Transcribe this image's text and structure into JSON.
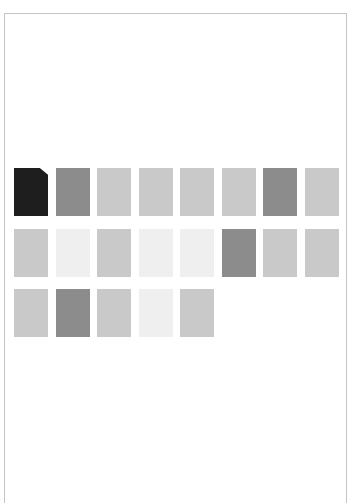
{
  "palette": {
    "black": "#1e1e1e",
    "dark": "#8c8c8c",
    "light": "#c9c9c9",
    "pale": "#efefef"
  },
  "tiles": [
    {
      "row": 1,
      "col": 1,
      "shade": "black",
      "folded": true
    },
    {
      "row": 1,
      "col": 2,
      "shade": "dark",
      "folded": false
    },
    {
      "row": 1,
      "col": 3,
      "shade": "light",
      "folded": false
    },
    {
      "row": 1,
      "col": 4,
      "shade": "light",
      "folded": false
    },
    {
      "row": 1,
      "col": 5,
      "shade": "light",
      "folded": false
    },
    {
      "row": 1,
      "col": 6,
      "shade": "light",
      "folded": false
    },
    {
      "row": 1,
      "col": 7,
      "shade": "dark",
      "folded": false
    },
    {
      "row": 1,
      "col": 8,
      "shade": "light",
      "folded": false
    },
    {
      "row": 2,
      "col": 1,
      "shade": "light",
      "folded": false
    },
    {
      "row": 2,
      "col": 2,
      "shade": "pale",
      "folded": false
    },
    {
      "row": 2,
      "col": 3,
      "shade": "light",
      "folded": false
    },
    {
      "row": 2,
      "col": 4,
      "shade": "pale",
      "folded": false
    },
    {
      "row": 2,
      "col": 5,
      "shade": "pale",
      "folded": false
    },
    {
      "row": 2,
      "col": 6,
      "shade": "dark",
      "folded": false
    },
    {
      "row": 2,
      "col": 7,
      "shade": "light",
      "folded": false
    },
    {
      "row": 2,
      "col": 8,
      "shade": "light",
      "folded": false
    },
    {
      "row": 3,
      "col": 1,
      "shade": "light",
      "folded": false
    },
    {
      "row": 3,
      "col": 2,
      "shade": "dark",
      "folded": false
    },
    {
      "row": 3,
      "col": 3,
      "shade": "light",
      "folded": false
    },
    {
      "row": 3,
      "col": 4,
      "shade": "pale",
      "folded": false
    },
    {
      "row": 3,
      "col": 5,
      "shade": "light",
      "folded": false
    }
  ]
}
